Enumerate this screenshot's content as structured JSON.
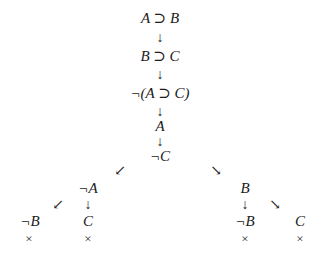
{
  "tableau": {
    "trunk": [
      {
        "id": "n1",
        "text": "A ⊃ B"
      },
      {
        "id": "n2",
        "text": "B ⊃ C"
      },
      {
        "id": "n3",
        "text": "¬(A ⊃ C)"
      },
      {
        "id": "n4",
        "text": "A"
      },
      {
        "id": "n5",
        "text": "¬C"
      }
    ],
    "left_branch": {
      "node": "¬A",
      "children": [
        {
          "text": "¬B",
          "closed": "×"
        },
        {
          "text": "C",
          "closed": "×"
        }
      ]
    },
    "right_branch": {
      "node": "B",
      "children": [
        {
          "text": "¬B",
          "closed": "×"
        },
        {
          "text": "C",
          "closed": "×"
        }
      ]
    },
    "arrows": {
      "down": "↓",
      "down_left": "↙",
      "down_right": "↘"
    }
  }
}
